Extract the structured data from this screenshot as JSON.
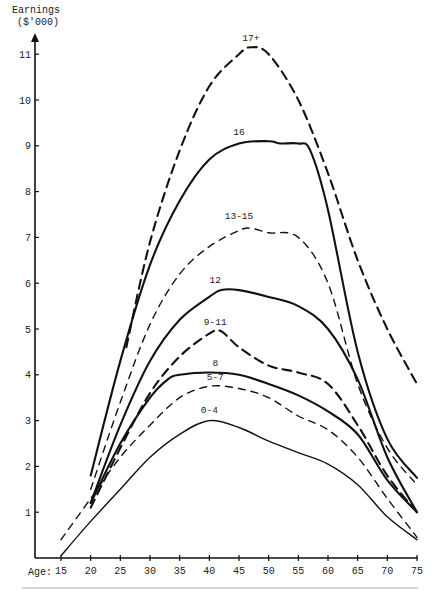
{
  "chart_data": {
    "type": "line",
    "title": "",
    "ylabel": "Earnings",
    "ylabel_units": "($'000)",
    "xlabel": "Age:",
    "xlim": [
      15,
      75
    ],
    "ylim": [
      0,
      11.3
    ],
    "grid": false,
    "legend": "inline labels at curve peaks",
    "x_ticks": [
      15,
      20,
      25,
      30,
      35,
      40,
      45,
      50,
      55,
      60,
      65,
      70,
      75
    ],
    "y_ticks": [
      1,
      2,
      3,
      4,
      5,
      6,
      7,
      8,
      9,
      10,
      11
    ],
    "series": [
      {
        "name": "17+",
        "style": "dashed",
        "weight": "bold",
        "x": [
          26,
          30,
          35,
          40,
          45,
          47,
          50,
          55,
          60,
          65,
          70,
          75
        ],
        "values": [
          4.6,
          6.9,
          8.9,
          10.3,
          11.0,
          11.15,
          11.0,
          10.0,
          8.4,
          6.5,
          5.0,
          3.8
        ],
        "label_pos": [
          47,
          11.25
        ]
      },
      {
        "name": "16",
        "style": "solid",
        "weight": "bold",
        "x": [
          20,
          25,
          30,
          35,
          40,
          45,
          50,
          52,
          55,
          57,
          60,
          65,
          70,
          75
        ],
        "values": [
          1.8,
          4.3,
          6.4,
          7.8,
          8.7,
          9.05,
          9.1,
          9.05,
          9.05,
          8.9,
          7.6,
          4.5,
          2.6,
          1.75
        ],
        "label_pos": [
          45,
          9.2
        ]
      },
      {
        "name": "13-15",
        "style": "dashed",
        "weight": "normal",
        "x": [
          20,
          25,
          30,
          35,
          40,
          45,
          47,
          50,
          55,
          60,
          65,
          70,
          75
        ],
        "values": [
          1.5,
          3.4,
          5.1,
          6.2,
          6.8,
          7.15,
          7.2,
          7.1,
          7.0,
          6.0,
          3.8,
          2.4,
          1.6
        ],
        "label_pos": [
          45,
          7.35
        ]
      },
      {
        "name": "12",
        "style": "solid",
        "weight": "bold",
        "x": [
          20,
          25,
          30,
          35,
          40,
          42,
          45,
          50,
          55,
          60,
          65,
          70,
          75
        ],
        "values": [
          1.2,
          2.9,
          4.3,
          5.2,
          5.7,
          5.85,
          5.85,
          5.7,
          5.5,
          5.0,
          3.9,
          2.2,
          1.0
        ],
        "label_pos": [
          41,
          5.95
        ]
      },
      {
        "name": "9-11",
        "style": "dashed",
        "weight": "bold",
        "x": [
          20,
          25,
          30,
          35,
          40,
          42,
          45,
          50,
          55,
          60,
          65,
          70,
          75
        ],
        "values": [
          1.1,
          2.4,
          3.6,
          4.4,
          4.9,
          4.95,
          4.6,
          4.2,
          4.05,
          3.8,
          2.9,
          1.8,
          1.0
        ],
        "label_pos": [
          41,
          5.05
        ]
      },
      {
        "name": "8",
        "style": "solid",
        "weight": "bold",
        "x": [
          20,
          25,
          30,
          33,
          35,
          40,
          45,
          50,
          55,
          60,
          65,
          70,
          75
        ],
        "values": [
          1.2,
          2.5,
          3.5,
          3.9,
          4.0,
          4.05,
          4.0,
          3.8,
          3.55,
          3.2,
          2.7,
          1.7,
          1.0
        ],
        "label_pos": [
          41,
          4.15
        ]
      },
      {
        "name": "5-7",
        "style": "dashed",
        "weight": "normal",
        "x": [
          15,
          20,
          25,
          30,
          35,
          40,
          45,
          50,
          55,
          60,
          65,
          70,
          75
        ],
        "values": [
          0.4,
          1.3,
          2.2,
          2.9,
          3.5,
          3.75,
          3.7,
          3.5,
          3.1,
          2.8,
          2.2,
          1.3,
          0.45
        ],
        "label_pos": [
          41,
          3.85
        ]
      },
      {
        "name": "0-4",
        "style": "solid",
        "weight": "normal",
        "x": [
          15,
          20,
          25,
          30,
          35,
          40,
          45,
          50,
          55,
          60,
          65,
          70,
          75
        ],
        "values": [
          0.05,
          0.8,
          1.5,
          2.2,
          2.7,
          3.0,
          2.85,
          2.55,
          2.3,
          2.05,
          1.6,
          0.9,
          0.4
        ],
        "label_pos": [
          40,
          3.12
        ]
      }
    ]
  }
}
